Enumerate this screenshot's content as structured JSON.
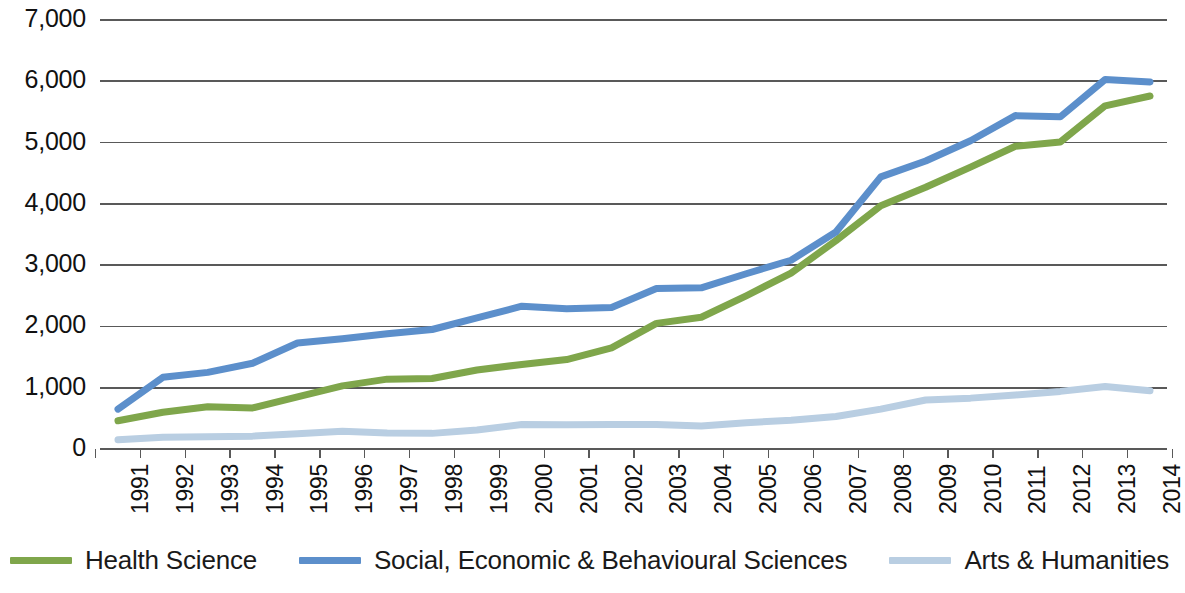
{
  "chart_data": {
    "type": "line",
    "title": "",
    "subtitle": "",
    "xlabel": "",
    "ylabel": "",
    "grid": true,
    "legend_position": "bottom",
    "ylim": [
      0,
      7000
    ],
    "y_ticks": [
      "0",
      "1,000",
      "2,000",
      "3,000",
      "4,000",
      "5,000",
      "6,000",
      "7,000"
    ],
    "y_tick_values": [
      0,
      1000,
      2000,
      3000,
      4000,
      5000,
      6000,
      7000
    ],
    "categories": [
      "1991",
      "1992",
      "1993",
      "1994",
      "1995",
      "1996",
      "1997",
      "1998",
      "1999",
      "2000",
      "2001",
      "2002",
      "2003",
      "2004",
      "2005",
      "2006",
      "2007",
      "2008",
      "2009",
      "2010",
      "2011",
      "2012",
      "2013",
      "2014"
    ],
    "x": [
      1991,
      1992,
      1993,
      1994,
      1995,
      1996,
      1997,
      1998,
      1999,
      2000,
      2001,
      2002,
      2003,
      2004,
      2005,
      2006,
      2007,
      2008,
      2009,
      2010,
      2011,
      2012,
      2013,
      2014
    ],
    "series": [
      {
        "name": "Health Science",
        "color": "#7FA64B",
        "values": [
          460,
          600,
          690,
          670,
          850,
          1030,
          1140,
          1150,
          1290,
          1380,
          1460,
          1650,
          2050,
          2150,
          2500,
          2870,
          3400,
          3970,
          4270,
          4600,
          4940,
          5010,
          5600,
          5760
        ]
      },
      {
        "name": "Social, Economic & Behavioural Sciences",
        "color": "#5C8FCB",
        "values": [
          650,
          1170,
          1250,
          1400,
          1730,
          1800,
          1880,
          1950,
          2140,
          2330,
          2290,
          2310,
          2620,
          2630,
          2860,
          3080,
          3540,
          4440,
          4700,
          5030,
          5440,
          5420,
          6030,
          5990
        ]
      },
      {
        "name": "Arts & Humanities",
        "color": "#B9CEE2",
        "values": [
          150,
          190,
          200,
          210,
          250,
          290,
          260,
          255,
          310,
          400,
          395,
          400,
          400,
          375,
          430,
          470,
          530,
          650,
          800,
          830,
          880,
          940,
          1020,
          950
        ]
      }
    ]
  },
  "legend": {
    "items": [
      {
        "label": "Health Science",
        "color": "#7FA64B"
      },
      {
        "label": "Social, Economic & Behavioural Sciences",
        "color": "#5C8FCB"
      },
      {
        "label": "Arts & Humanities",
        "color": "#B9CEE2"
      }
    ]
  },
  "axes": {
    "gridline_color": "#595959",
    "axis_color": "#595959"
  }
}
